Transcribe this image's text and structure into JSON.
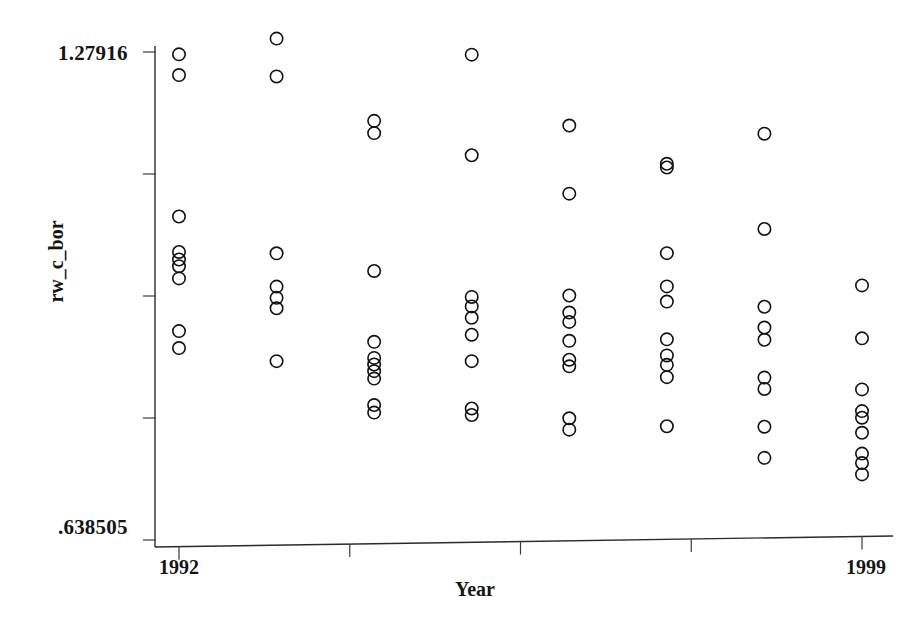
{
  "chart_data": {
    "type": "scatter",
    "title": "",
    "xlabel": "Year",
    "ylabel": "rw_c_bor",
    "grid": false,
    "legend": "none",
    "xlim": [
      1992,
      1999
    ],
    "ylim": [
      0.638505,
      1.27916
    ],
    "y_tick_labels": [
      "1.27916",
      ".638505"
    ],
    "y_tick_values": [
      1.27916,
      0.638505
    ],
    "x_tick_labels": [
      "1992",
      "1999"
    ],
    "x_tick_values": [
      1992,
      1999
    ],
    "x_minor_tick_count": 5,
    "y_minor_tick_count": 5,
    "marker": "open-circle",
    "marker_color": "#111111",
    "categories": [
      1992,
      1993,
      1994,
      1995,
      1996,
      1997,
      1998,
      1999
    ],
    "series": [
      {
        "name": "rw_c_bor",
        "points": [
          {
            "x": 1992,
            "y": 1.2756
          },
          {
            "x": 1992,
            "y": 1.2484
          },
          {
            "x": 1992,
            "y": 1.0627
          },
          {
            "x": 1992,
            "y": 1.0162
          },
          {
            "x": 1992,
            "y": 1.0063
          },
          {
            "x": 1992,
            "y": 0.9975
          },
          {
            "x": 1992,
            "y": 0.9815
          },
          {
            "x": 1992,
            "y": 0.9123
          },
          {
            "x": 1992,
            "y": 0.89
          },
          {
            "x": 1993,
            "y": 1.2944
          },
          {
            "x": 1993,
            "y": 1.2447
          },
          {
            "x": 1993,
            "y": 1.0125
          },
          {
            "x": 1993,
            "y": 0.9688
          },
          {
            "x": 1993,
            "y": 0.954
          },
          {
            "x": 1993,
            "y": 0.9403
          },
          {
            "x": 1993,
            "y": 0.8709
          },
          {
            "x": 1994,
            "y": 1.1845
          },
          {
            "x": 1994,
            "y": 1.1684
          },
          {
            "x": 1994,
            "y": 0.9874
          },
          {
            "x": 1994,
            "y": 0.8944
          },
          {
            "x": 1994,
            "y": 0.8733
          },
          {
            "x": 1994,
            "y": 0.8646
          },
          {
            "x": 1994,
            "y": 0.8559
          },
          {
            "x": 1994,
            "y": 0.8461
          },
          {
            "x": 1994,
            "y": 0.8114
          },
          {
            "x": 1994,
            "y": 0.8015
          },
          {
            "x": 1995,
            "y": 1.2695
          },
          {
            "x": 1995,
            "y": 1.1374
          },
          {
            "x": 1995,
            "y": 0.9514
          },
          {
            "x": 1995,
            "y": 0.939
          },
          {
            "x": 1995,
            "y": 0.9241
          },
          {
            "x": 1995,
            "y": 0.9018
          },
          {
            "x": 1995,
            "y": 0.8671
          },
          {
            "x": 1995,
            "y": 0.805
          },
          {
            "x": 1995,
            "y": 0.7964
          },
          {
            "x": 1996,
            "y": 1.1745
          },
          {
            "x": 1996,
            "y": 1.0851
          },
          {
            "x": 1996,
            "y": 0.9514
          },
          {
            "x": 1996,
            "y": 0.929
          },
          {
            "x": 1996,
            "y": 0.9167
          },
          {
            "x": 1996,
            "y": 0.8919
          },
          {
            "x": 1996,
            "y": 0.8671
          },
          {
            "x": 1996,
            "y": 0.8584
          },
          {
            "x": 1996,
            "y": 0.7902
          },
          {
            "x": 1996,
            "y": 0.7753
          },
          {
            "x": 1997,
            "y": 1.1224
          },
          {
            "x": 1997,
            "y": 1.1175
          },
          {
            "x": 1997,
            "y": 1.0051
          },
          {
            "x": 1997,
            "y": 0.9614
          },
          {
            "x": 1997,
            "y": 0.9415
          },
          {
            "x": 1997,
            "y": 0.8919
          },
          {
            "x": 1997,
            "y": 0.8708
          },
          {
            "x": 1997,
            "y": 0.8584
          },
          {
            "x": 1997,
            "y": 0.8423
          },
          {
            "x": 1997,
            "y": 0.7778
          },
          {
            "x": 1998,
            "y": 1.16
          },
          {
            "x": 1998,
            "y": 1.0349
          },
          {
            "x": 1998,
            "y": 0.9328
          },
          {
            "x": 1998,
            "y": 0.9055
          },
          {
            "x": 1998,
            "y": 0.8894
          },
          {
            "x": 1998,
            "y": 0.8398
          },
          {
            "x": 1998,
            "y": 0.8249
          },
          {
            "x": 1998,
            "y": 0.7753
          },
          {
            "x": 1998,
            "y": 0.7344
          },
          {
            "x": 1999,
            "y": 0.9589
          },
          {
            "x": 1999,
            "y": 0.8894
          },
          {
            "x": 1999,
            "y": 0.8224
          },
          {
            "x": 1999,
            "y": 0.7939
          },
          {
            "x": 1999,
            "y": 0.7852
          },
          {
            "x": 1999,
            "y": 0.7654
          },
          {
            "x": 1999,
            "y": 0.7381
          },
          {
            "x": 1999,
            "y": 0.7257
          },
          {
            "x": 1999,
            "y": 0.7108
          }
        ]
      }
    ]
  }
}
